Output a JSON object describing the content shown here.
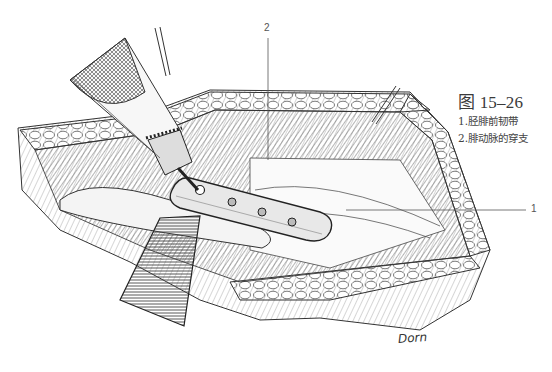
{
  "figure": {
    "title": "图 15–26",
    "legend": [
      {
        "number": "1",
        "text": "1.胫腓前韧带"
      },
      {
        "number": "2",
        "text": "2.腓动脉的穿支"
      }
    ]
  },
  "callouts": {
    "label_1": "1",
    "label_2": "2"
  },
  "illustration": {
    "subject": "surgical-exposure-with-plate-and-drill",
    "signature": "Dorn",
    "ink_color": "#2b2b2b",
    "paper_color": "#ffffff"
  }
}
